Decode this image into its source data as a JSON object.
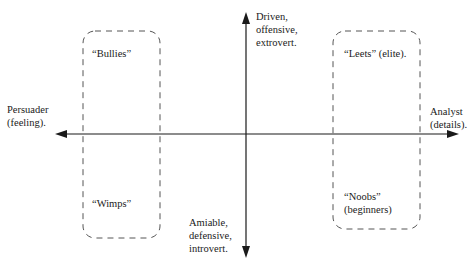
{
  "axes": {
    "horizontal": {
      "left_label_line1": "Persuader",
      "left_label_line2": "(feeling).",
      "right_label_line1": "Analyst",
      "right_label_line2": "(details)."
    },
    "vertical": {
      "top_label_line1": "Driven,",
      "top_label_line2": "offensive,",
      "top_label_line3": "extrovert.",
      "bottom_label_line1": "Amiable,",
      "bottom_label_line2": "defensive,",
      "bottom_label_line3": "introvert."
    }
  },
  "groups": {
    "left": {
      "top_label": "“Bullies”",
      "bottom_label": "“Wimps”"
    },
    "right": {
      "top_label": "“Leets” (elite).",
      "bottom_label_line1": "“Noobs”",
      "bottom_label_line2": "(beginners)"
    }
  },
  "colors": {
    "ink": "#1a1a1a",
    "dash": "#555555",
    "background": "#ffffff"
  }
}
